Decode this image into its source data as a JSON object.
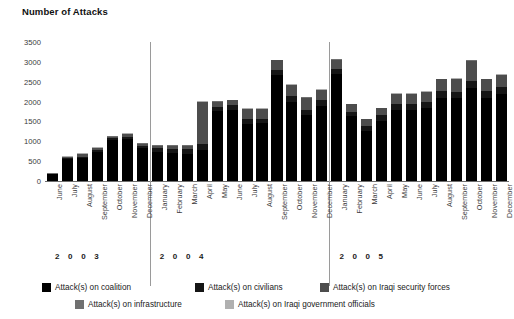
{
  "chart_data": {
    "type": "bar",
    "stacked": true,
    "title": "Number of Attacks",
    "xlabel": "",
    "ylabel": "Number of Attacks",
    "ylim": [
      0,
      3500
    ],
    "ytick_labels": [
      "3500",
      "3000",
      "2500",
      "2000",
      "1500",
      "1000",
      "500",
      "0"
    ],
    "yticks": [
      3500,
      3000,
      2500,
      2000,
      1500,
      1000,
      500,
      0
    ],
    "grid": false,
    "legend_position": "bottom",
    "year_groups": [
      {
        "label": "2 0 0 3",
        "start_index": 0,
        "count": 7
      },
      {
        "label": "2 0 0 4",
        "start_index": 7,
        "count": 12
      },
      {
        "label": "2 0 0 5",
        "start_index": 19,
        "count": 12
      }
    ],
    "categories": [
      "June",
      "July",
      "August",
      "September",
      "October",
      "November",
      "December",
      "January",
      "February",
      "March",
      "April",
      "May",
      "June",
      "July",
      "August",
      "September",
      "October",
      "November",
      "December",
      "January",
      "February",
      "March",
      "April",
      "May",
      "June",
      "July",
      "August",
      "September",
      "October",
      "November",
      "December"
    ],
    "series": [
      {
        "name": "Attack(s) on coalition",
        "color": "#000000",
        "values": [
          170,
          560,
          570,
          730,
          1040,
          1060,
          830,
          720,
          700,
          690,
          790,
          1760,
          1800,
          1440,
          1450,
          2680,
          2000,
          1670,
          1900,
          2700,
          1630,
          1270,
          1520,
          1800,
          1800,
          1830,
          2100,
          2080,
          2330,
          2100,
          2190
        ]
      },
      {
        "name": "Attack(s) on civilians",
        "color": "#151515",
        "values": [
          10,
          20,
          40,
          50,
          40,
          60,
          60,
          100,
          110,
          110,
          140,
          110,
          110,
          110,
          120,
          120,
          130,
          130,
          140,
          130,
          120,
          120,
          130,
          140,
          140,
          150,
          160,
          170,
          180,
          170,
          180
        ]
      },
      {
        "name": "Attack(s) on Iraqi security forces",
        "color": "#4d4d4d",
        "values": [
          8,
          20,
          60,
          50,
          40,
          60,
          50,
          70,
          80,
          90,
          1060,
          130,
          120,
          260,
          240,
          240,
          290,
          300,
          250,
          230,
          180,
          160,
          180,
          250,
          250,
          260,
          300,
          320,
          520,
          290,
          300
        ]
      },
      {
        "name": "Attack(s) on infrastructure",
        "color": "#707070",
        "values": [
          5,
          10,
          15,
          10,
          10,
          10,
          10,
          10,
          10,
          10,
          10,
          10,
          10,
          10,
          10,
          10,
          10,
          10,
          10,
          10,
          10,
          10,
          10,
          10,
          10,
          10,
          10,
          10,
          10,
          10,
          10
        ]
      },
      {
        "name": "Attack(s) on Iraqi government officials",
        "color": "#b0b0b0",
        "values": [
          5,
          10,
          15,
          10,
          10,
          10,
          10,
          10,
          10,
          10,
          10,
          10,
          10,
          10,
          10,
          10,
          10,
          10,
          10,
          10,
          10,
          10,
          10,
          10,
          10,
          10,
          10,
          10,
          10,
          10,
          10
        ]
      }
    ],
    "totals": [
      198,
      620,
      700,
      850,
      1140,
      1200,
      960,
      910,
      910,
      910,
      2010,
      2020,
      2050,
      1830,
      1830,
      3060,
      2440,
      2120,
      2310,
      3080,
      1950,
      1570,
      1850,
      2210,
      2210,
      2260,
      2580,
      2590,
      3050,
      2580,
      2690
    ]
  },
  "legend": {
    "items": [
      {
        "label": "Attack(s) on coalition",
        "color": "#000000"
      },
      {
        "label": "Attack(s) on civilians",
        "color": "#151515"
      },
      {
        "label": "Attack(s) on Iraqi security forces",
        "color": "#4d4d4d"
      },
      {
        "label": "Attack(s) on infrastructure",
        "color": "#707070"
      },
      {
        "label": "Attack(s) on Iraqi government officials",
        "color": "#b0b0b0"
      }
    ]
  }
}
